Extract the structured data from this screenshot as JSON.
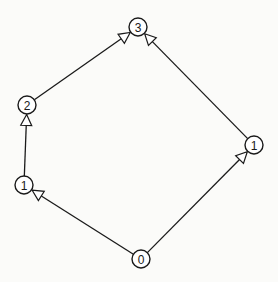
{
  "diagram": {
    "type": "directed-graph",
    "node_radius": 9,
    "colors": {
      "background": "#fbfbf9",
      "stroke": "#1a1a1a",
      "node_fill": "#ffffff"
    },
    "nodes": [
      {
        "id": "n0",
        "label": "0",
        "x": 141,
        "y": 259
      },
      {
        "id": "n1l",
        "label": "1",
        "x": 24,
        "y": 185
      },
      {
        "id": "n2",
        "label": "2",
        "x": 27,
        "y": 105
      },
      {
        "id": "n3",
        "label": "3",
        "x": 138,
        "y": 27
      },
      {
        "id": "n1r",
        "label": "1",
        "x": 254,
        "y": 145
      }
    ],
    "edges": [
      {
        "from": "n0",
        "to": "n1l",
        "arrow": "open-triangle"
      },
      {
        "from": "n1l",
        "to": "n2",
        "arrow": "open-triangle"
      },
      {
        "from": "n2",
        "to": "n3",
        "arrow": "open-triangle"
      },
      {
        "from": "n0",
        "to": "n1r",
        "arrow": "open-triangle"
      },
      {
        "from": "n1r",
        "to": "n3",
        "arrow": "open-triangle"
      }
    ]
  }
}
